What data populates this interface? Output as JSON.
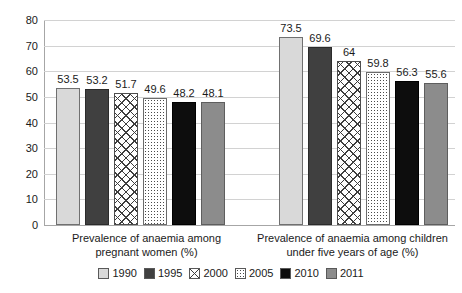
{
  "chart_data": {
    "type": "bar",
    "title": "",
    "subtitle": "",
    "xlabel": "",
    "ylabel": "",
    "ylim": [
      0,
      80
    ],
    "yticks": [
      0,
      10,
      20,
      30,
      40,
      50,
      60,
      70,
      80
    ],
    "ytick_labels": [
      "0",
      "10",
      "20",
      "30",
      "40",
      "50",
      "60",
      "70",
      "80"
    ],
    "grid": true,
    "grid_axis": "y",
    "legend_position": "bottom",
    "categories": [
      "Prevalence of anaemia among pregnant women (%)",
      "Prevalence of anaemia among children under five years of age (%)"
    ],
    "category_lines": [
      [
        "Prevalence of anaemia among",
        "pregnant women (%)"
      ],
      [
        "Prevalence of anaemia among children",
        "under five years of age (%)"
      ]
    ],
    "series": [
      {
        "name": "1990",
        "values": [
          53.5,
          73.5
        ],
        "labels": [
          "53.5",
          "73.5"
        ],
        "fill": "solid-light",
        "color": "#d9d9d9"
      },
      {
        "name": "1995",
        "values": [
          53.2,
          69.6
        ],
        "labels": [
          "53.2",
          "69.6"
        ],
        "fill": "solid-dark",
        "color": "#404040"
      },
      {
        "name": "2000",
        "values": [
          51.7,
          64
        ],
        "labels": [
          "51.7",
          "64"
        ],
        "fill": "crosshatch",
        "color": "#ffffff"
      },
      {
        "name": "2005",
        "values": [
          49.6,
          59.8
        ],
        "labels": [
          "49.6",
          "59.8"
        ],
        "fill": "dotted",
        "color": "#ffffff"
      },
      {
        "name": "2010",
        "values": [
          48.2,
          56.3
        ],
        "labels": [
          "48.2",
          "56.3"
        ],
        "fill": "solid-black",
        "color": "#0d0d0d"
      },
      {
        "name": "2011",
        "values": [
          48.1,
          55.6
        ],
        "labels": [
          "48.1",
          "55.6"
        ],
        "fill": "solid-mid",
        "color": "#8c8c8c"
      }
    ],
    "colors": {
      "gridline": "#d2d2d2",
      "axis": "#a6a6a6",
      "text": "#1a1a1a",
      "background": "#ffffff"
    }
  }
}
